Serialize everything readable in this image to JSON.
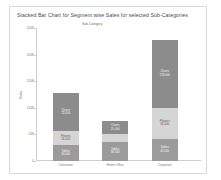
{
  "chart": {
    "title": "Stacked Bar Chart for Segment wise Sales for selected Sub-Categories",
    "legend_title": "Sub-Category",
    "ylabel": "Sales"
  },
  "chart_data": {
    "type": "bar",
    "stacked": true,
    "title": "Stacked Bar Chart for Segment wise Sales for selected Sub-Categories",
    "xlabel": "",
    "ylabel": "Sales",
    "ylim": [
      0,
      250000
    ],
    "yticks": [
      0,
      50000,
      100000,
      150000,
      200000,
      250000
    ],
    "ytick_labels": [
      "0",
      "50K",
      "100K",
      "150K",
      "200K",
      "250K"
    ],
    "grid": false,
    "legend_position": "top",
    "legend_entries": [
      "Chairs",
      "Phones",
      "Tables"
    ],
    "categories": [
      "Consumer",
      "Home Office",
      "Corporate"
    ],
    "series": [
      {
        "name": "Tables",
        "color": "#9b9b9b",
        "values": [
          30000,
          36000,
          42000
        ]
      },
      {
        "name": "Phones",
        "color": "#d5d5d5",
        "values": [
          26000,
          14000,
          58000
        ]
      },
      {
        "name": "Chairs",
        "color": "#8c8c8c",
        "values": [
          72000,
          25000,
          128000
        ]
      }
    ],
    "bar_labels": [
      [
        "Tables\n30,000",
        "Phones\n26,000",
        "Chairs\n72,000"
      ],
      [
        "Tables\n36,000",
        "Phones\n14,000",
        "Chairs\n25,000"
      ],
      [
        "Tables\n42,000",
        "Phones\n58,000",
        "Chairs\n128,000"
      ]
    ],
    "colors": {
      "tables": "#9b9b9b",
      "phones": "#d5d5d5",
      "chairs": "#8c8c8c",
      "axis": "#cfcfcf",
      "text": "#777777",
      "title": "#4a4a4a",
      "card_border": "#d8d8d8",
      "background": "#ffffff"
    }
  }
}
